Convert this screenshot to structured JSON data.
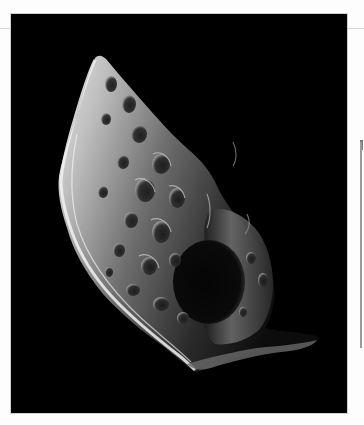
{
  "image": {
    "subject": "Cratered irregular moon on black space background",
    "alt": "Grayscale photograph of an irregular, heavily cratered moon against black space",
    "frame_bg": "#000000",
    "page_bg": "#fdfdfd",
    "rule_color": "#d6d6d6",
    "side_bar_color": "#9a9a9a"
  }
}
